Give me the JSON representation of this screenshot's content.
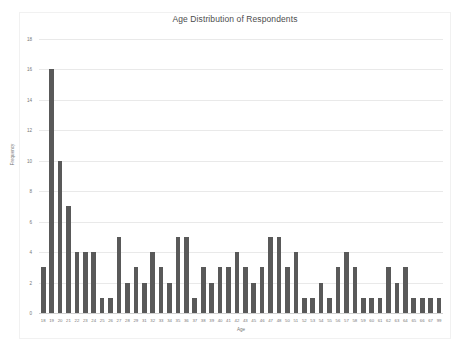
{
  "chart_data": {
    "type": "bar",
    "title": "Age Distribution of Respondents",
    "xlabel": "Age",
    "ylabel": "Frequency",
    "ylim": [
      0,
      18
    ],
    "ytick_step": 2,
    "yticks": [
      0,
      2,
      4,
      6,
      8,
      10,
      12,
      14,
      16,
      18
    ],
    "grid": true,
    "legend": false,
    "bar_color": "#595959",
    "gridline_color": "#e9e9e9",
    "categories": [
      "18",
      "19",
      "20",
      "21",
      "22",
      "23",
      "24",
      "25",
      "26",
      "27",
      "28",
      "29",
      "31",
      "32",
      "33",
      "34",
      "35",
      "36",
      "37",
      "38",
      "39",
      "40",
      "41",
      "42",
      "43",
      "45",
      "46",
      "47",
      "48",
      "50",
      "51",
      "52",
      "53",
      "54",
      "55",
      "56",
      "57",
      "58",
      "59",
      "60",
      "61",
      "62",
      "63",
      "64",
      "65",
      "66",
      "67",
      "99"
    ],
    "values": [
      3,
      16,
      10,
      7,
      4,
      4,
      4,
      1,
      1,
      5,
      2,
      3,
      2,
      4,
      3,
      2,
      5,
      5,
      1,
      3,
      2,
      3,
      3,
      4,
      3,
      2,
      3,
      5,
      5,
      3,
      4,
      1,
      1,
      2,
      1,
      3,
      4,
      3,
      1,
      1,
      1,
      3,
      2,
      3,
      1,
      1,
      1,
      1
    ]
  }
}
